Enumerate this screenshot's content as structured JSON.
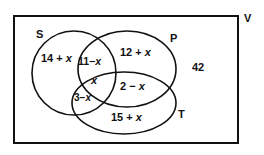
{
  "diagram": {
    "type": "venn",
    "universe": {
      "label": "V",
      "outside_value": "42"
    },
    "sets": [
      {
        "name": "S",
        "label": "S"
      },
      {
        "name": "P",
        "label": "P"
      },
      {
        "name": "T",
        "label": "T"
      }
    ],
    "regions": {
      "S_only": {
        "num": "14 + ",
        "var": "x"
      },
      "S_P_only": {
        "num": "11−",
        "var": "x"
      },
      "S_P_T": {
        "num": "",
        "var": "x"
      },
      "S_T_only": {
        "num": "3−",
        "var": "x"
      },
      "P_only": {
        "num": "12 + ",
        "var": "x"
      },
      "P_T_only": {
        "num": "2 − ",
        "var": "x"
      },
      "T_only": {
        "num": "15 + ",
        "var": "x"
      }
    },
    "line_color": "#111111"
  }
}
